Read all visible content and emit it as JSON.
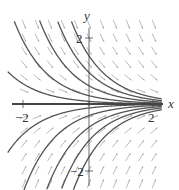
{
  "figure": {
    "type": "direction-field",
    "equation_note": "solution curves y = C e^(-x)",
    "axes": {
      "x_label": "x",
      "y_label": "y",
      "x_ticks": [
        {
          "value": -2,
          "label": "−2"
        },
        {
          "value": 2,
          "label": "2"
        }
      ],
      "y_ticks": [
        {
          "value": 2,
          "label": "2"
        },
        {
          "value": -2,
          "label": "−2"
        }
      ],
      "xlim": [
        -2.5,
        2.2
      ],
      "ylim": [
        -2.6,
        2.8
      ]
    },
    "colors": {
      "curve": "#555555",
      "arrow": "#aaaaaa",
      "axis": "#444444"
    },
    "curve_constants": [
      0.08,
      0.25,
      0.55,
      0.95,
      1.45,
      -0.12,
      -0.35,
      -0.7,
      -1.1,
      -1.6
    ],
    "arrow_grid": {
      "x_step": 0.4,
      "y_step": 0.4
    }
  },
  "chart_data": {
    "type": "line",
    "title": "",
    "xlabel": "x",
    "ylabel": "y",
    "xlim": [
      -2.5,
      2.2
    ],
    "ylim": [
      -2.6,
      2.8
    ],
    "series": [
      {
        "name": "C=0",
        "function": "y=0"
      },
      {
        "name": "C=0.08",
        "function": "y=0.08e^(-x)"
      },
      {
        "name": "C=0.25",
        "function": "y=0.25e^(-x)"
      },
      {
        "name": "C=0.55",
        "function": "y=0.55e^(-x)"
      },
      {
        "name": "C=0.95",
        "function": "y=0.95e^(-x)"
      },
      {
        "name": "C=1.45",
        "function": "y=1.45e^(-x)"
      },
      {
        "name": "C=-0.12",
        "function": "y=-0.12e^(-x)"
      },
      {
        "name": "C=-0.35",
        "function": "y=-0.35e^(-x)"
      },
      {
        "name": "C=-0.7",
        "function": "y=-0.7e^(-x)"
      },
      {
        "name": "C=-1.1",
        "function": "y=-1.1e^(-x)"
      },
      {
        "name": "C=-1.6",
        "function": "y=-1.6e^(-x)"
      }
    ],
    "grid": false,
    "legend": "none"
  }
}
